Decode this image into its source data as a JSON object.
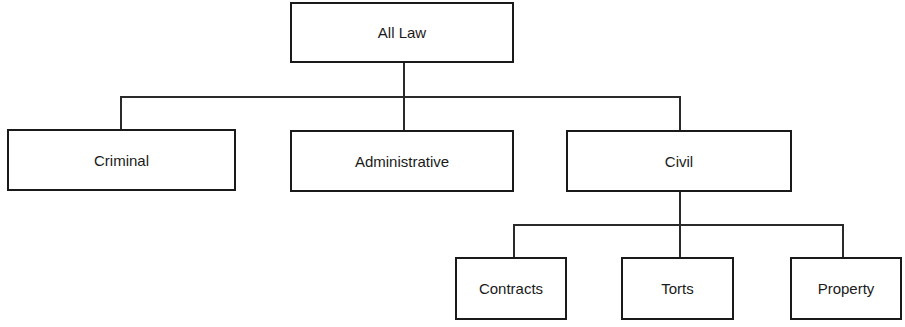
{
  "diagram": {
    "type": "tree",
    "root": {
      "label": "All Law",
      "children": [
        {
          "label": "Criminal"
        },
        {
          "label": "Administrative"
        },
        {
          "label": "Civil",
          "children": [
            {
              "label": "Contracts"
            },
            {
              "label": "Torts"
            },
            {
              "label": "Property"
            }
          ]
        }
      ]
    }
  },
  "nodes": {
    "all_law": "All Law",
    "criminal": "Criminal",
    "administrative": "Administrative",
    "civil": "Civil",
    "contracts": "Contracts",
    "torts": "Torts",
    "property": "Property"
  },
  "colors": {
    "line": "#1a1a1a",
    "background": "#ffffff"
  }
}
